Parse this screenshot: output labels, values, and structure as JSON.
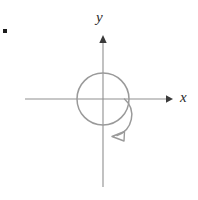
{
  "figure": {
    "type": "math-diagram",
    "background_color": "#ffffff",
    "axis_color": "#8f8f8f",
    "curve_color": "#9a9a9a",
    "label_color": "#2b2b2b",
    "bullet_color": "#1c1c1c",
    "axes": {
      "x_label": "x",
      "y_label": "y",
      "origin": {
        "x": 103,
        "y": 99
      },
      "x_range": [
        25,
        172
      ],
      "y_range": [
        36,
        187
      ],
      "x_arrow": "right",
      "y_arrow": "up"
    },
    "circle": {
      "center": {
        "x": 103,
        "y": 99
      },
      "radius": 26
    },
    "spiral": {
      "direction": "counterclockwise",
      "arrow_tip": {
        "x": 116,
        "y": 137
      },
      "inner_radius": 21
    },
    "bullet": {
      "x": 3,
      "y": 29,
      "size": 4
    }
  }
}
